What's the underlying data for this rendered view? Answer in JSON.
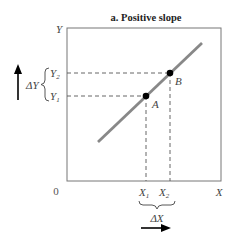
{
  "title": "a. Positive slope",
  "axes": {
    "y_label": "Y",
    "x_label": "X",
    "origin_label": "0"
  },
  "points": [
    {
      "name": "A",
      "x_label": "X",
      "x_sub": "1",
      "y_label": "Y",
      "y_sub": "1"
    },
    {
      "name": "B",
      "x_label": "X",
      "x_sub": "2",
      "y_label": "Y",
      "y_sub": "2"
    }
  ],
  "delta": {
    "y": "ΔY",
    "x": "ΔX"
  },
  "colors": {
    "line": "#888888",
    "axis": "#777777",
    "dashed": "#555555",
    "point": "#000000"
  }
}
